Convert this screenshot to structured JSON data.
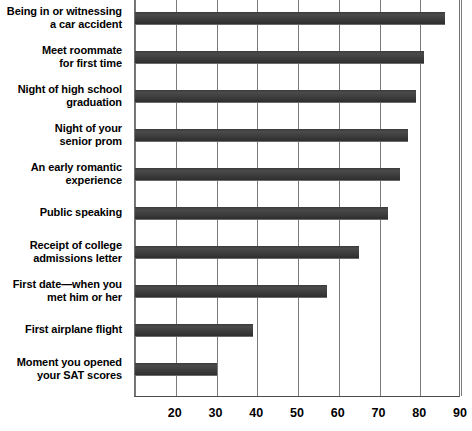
{
  "chart_data": {
    "type": "bar",
    "orientation": "horizontal",
    "title": "",
    "subtitle": "",
    "xlabel": "",
    "ylabel": "",
    "xlim": [
      10,
      90
    ],
    "ylim": null,
    "grid": true,
    "legend": null,
    "legend_position": "none",
    "xticks": [
      10,
      20,
      30,
      40,
      50,
      60,
      70,
      80,
      90
    ],
    "xtick_labels": [
      "",
      "20",
      "30",
      "40",
      "50",
      "60",
      "70",
      "80",
      "90"
    ],
    "categories": [
      "Being in or witnessing\na car accident",
      "Meet roommate\nfor first time",
      "Night of high school\ngraduation",
      "Night of your\nsenior prom",
      "An early romantic\nexperience",
      "Public speaking",
      "Receipt of college\nadmissions letter",
      "First date—when you\nmet him or her",
      "First airplane flight",
      "Moment you opened\nyour SAT scores"
    ],
    "values": [
      86,
      81,
      79,
      77,
      75,
      72,
      65,
      57,
      39,
      30
    ],
    "bar_color": "#3f3f3f",
    "gridline_color": "#7a7a7a",
    "background_color": "#ffffff"
  },
  "labels": [
    {
      "line1": "Being in or witnessing",
      "line2": "a car accident"
    },
    {
      "line1": "Meet roommate",
      "line2": "for first time"
    },
    {
      "line1": "Night of high school",
      "line2": "graduation"
    },
    {
      "line1": "Night of your",
      "line2": "senior prom"
    },
    {
      "line1": "An early romantic",
      "line2": "experience"
    },
    {
      "line1": "Public speaking",
      "line2": ""
    },
    {
      "line1": "Receipt of college",
      "line2": "admissions letter"
    },
    {
      "line1": "First date—when you",
      "line2": "met him or her"
    },
    {
      "line1": "First airplane flight",
      "line2": ""
    },
    {
      "line1": "Moment you opened",
      "line2": "your SAT scores"
    }
  ],
  "axis": {
    "ticks": [
      "20",
      "30",
      "40",
      "50",
      "60",
      "70",
      "80",
      "90"
    ]
  }
}
